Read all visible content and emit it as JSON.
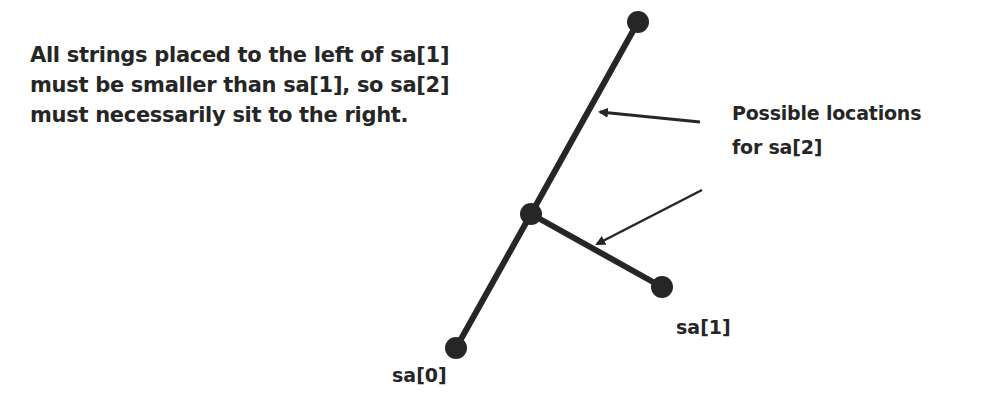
{
  "diagram": {
    "type": "tree",
    "description_note": {
      "lines": [
        "All strings placed to the left of sa[1]",
        "must be smaller than sa[1], so sa[2]",
        "must necessarily sit to the right."
      ]
    },
    "callout": {
      "lines": [
        "Possible locations",
        "for sa[2]"
      ],
      "arrow_count": 2
    },
    "nodes": [
      {
        "id": "top",
        "label": ""
      },
      {
        "id": "branch",
        "label": ""
      },
      {
        "id": "sa1",
        "label": "sa[1]"
      },
      {
        "id": "sa0",
        "label": "sa[0]"
      }
    ],
    "edges": [
      {
        "from": "sa0",
        "to": "branch"
      },
      {
        "from": "branch",
        "to": "top"
      },
      {
        "from": "branch",
        "to": "sa1"
      }
    ],
    "colors": {
      "ink": "#262626",
      "background": "#ffffff"
    }
  }
}
